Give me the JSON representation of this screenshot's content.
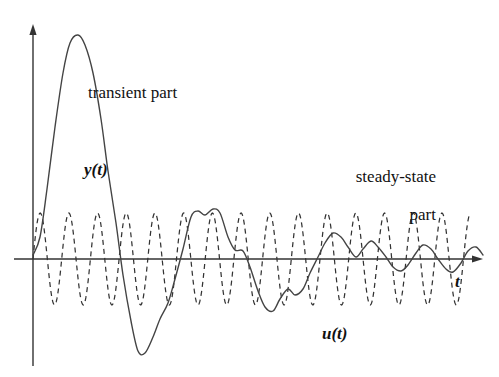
{
  "figure": {
    "background_color": "#ffffff",
    "ink_color": "#333333",
    "width": 499,
    "height": 377
  },
  "annotations": {
    "transient_label": "transient part",
    "steady_state_label_line1": "steady-state",
    "steady_state_label_line2": "part",
    "output_signal_label": "y(t)",
    "input_signal_label": "u(t)",
    "time_axis_label": "t"
  },
  "axes": {
    "origin_x": 33,
    "origin_y": 259,
    "y_axis_top_y": 25,
    "t_axis_right_x": 482,
    "y_axis_has_arrow": true,
    "t_axis_has_arrow": true,
    "grid": false,
    "tick_labels": []
  },
  "chart_data": {
    "type": "line",
    "title": "",
    "subtitle": "",
    "xlabel": "t",
    "ylabel": "",
    "xlim": [
      0,
      460
    ],
    "ylim": [
      -100,
      240
    ],
    "grid": false,
    "legend": "inline-annotations",
    "annotations": [
      {
        "text": "transient part",
        "x": 95,
        "y": 180
      },
      {
        "text": "steady-state part",
        "x": 375,
        "y": 100
      },
      {
        "text": "y(t)",
        "x": 62,
        "y": 88
      },
      {
        "text": "u(t)",
        "x": 315,
        "y": -78
      },
      {
        "text": "t",
        "x": 430,
        "y": -18
      }
    ],
    "series": [
      {
        "name": "u(t)",
        "style": "dashed",
        "description": "sinusoidal input, constant amplitude",
        "amplitude": 46,
        "period_px": 28.7,
        "phase_deg": 0,
        "x": [
          0,
          28.7,
          57.4,
          86.1,
          114.8,
          143.5,
          172.2,
          200.9,
          229.6,
          258.3,
          287,
          315.7,
          344.4,
          373.1,
          401.8,
          430.5
        ],
        "values": [
          0,
          0,
          0,
          0,
          0,
          0,
          0,
          0,
          0,
          0,
          0,
          0,
          0,
          0,
          0,
          0
        ]
      },
      {
        "name": "y(t)",
        "style": "solid",
        "description": "system output: large transient overshoot decaying into a steady-state sinusoid",
        "x": [
          0,
          7,
          14,
          22,
          30,
          37,
          45,
          52,
          60,
          68,
          75,
          83,
          90,
          98,
          105,
          112,
          120,
          127,
          135,
          142,
          150,
          158,
          165,
          172,
          180,
          187,
          195,
          202,
          210,
          217,
          225,
          232,
          240,
          247,
          255,
          262,
          270,
          277,
          285,
          292,
          300,
          308,
          315,
          323,
          330,
          338,
          345,
          353,
          360,
          368,
          375,
          383,
          390,
          398,
          405,
          413,
          420,
          428,
          435,
          443,
          450
        ],
        "values": [
          4,
          22,
          70,
          132,
          186,
          216,
          224,
          214,
          186,
          140,
          88,
          36,
          -16,
          -62,
          -92,
          -94,
          -78,
          -60,
          -44,
          -20,
          10,
          42,
          48,
          44,
          50,
          46,
          22,
          9,
          8,
          -8,
          -32,
          -48,
          -52,
          -40,
          -30,
          -36,
          -30,
          -14,
          2,
          16,
          26,
          22,
          12,
          2,
          10,
          18,
          12,
          2,
          -8,
          -12,
          -6,
          6,
          14,
          10,
          0,
          -10,
          -13,
          -4,
          8,
          12,
          4
        ]
      }
    ]
  }
}
